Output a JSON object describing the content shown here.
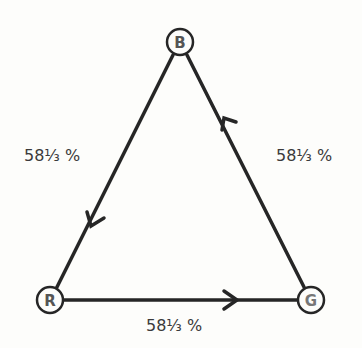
{
  "diagram": {
    "nodes": [
      {
        "id": "B",
        "label": "B",
        "x": 180,
        "y": 42
      },
      {
        "id": "R",
        "label": "R",
        "x": 50,
        "y": 300
      },
      {
        "id": "G",
        "label": "G",
        "x": 311,
        "y": 300
      }
    ],
    "edges": [
      {
        "from": "B",
        "to": "R",
        "label": "58⅓ %"
      },
      {
        "from": "R",
        "to": "G",
        "label": "58⅓ %"
      },
      {
        "from": "G",
        "to": "B",
        "label": "58⅓ %"
      }
    ],
    "colors": {
      "line": "#262626",
      "text": "#3a3a3a",
      "background": "#fdfdfb"
    }
  }
}
